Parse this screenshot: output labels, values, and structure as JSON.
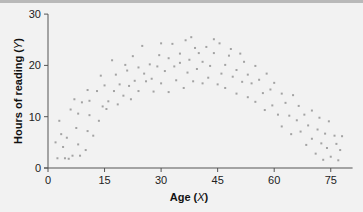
{
  "chart_data": {
    "type": "scatter",
    "title": "",
    "xlabel": "Age (X)",
    "ylabel": "Hours of reading (Y)",
    "xlabel_parts": {
      "text": "Age (",
      "var": "X",
      "close": ")"
    },
    "ylabel_parts": {
      "text": "Hours of reading (",
      "var": "Y",
      "close": ")"
    },
    "xlim": [
      0,
      80
    ],
    "ylim": [
      0,
      30
    ],
    "xticks": [
      0,
      15,
      30,
      45,
      60,
      75
    ],
    "yticks": [
      0,
      10,
      20,
      30
    ],
    "grid": false,
    "legend": null,
    "point_color": "#a3a3a3",
    "axis_color": "#555555",
    "points": [
      [
        2,
        5
      ],
      [
        2.5,
        1.9
      ],
      [
        3,
        9.2
      ],
      [
        3.5,
        6.6
      ],
      [
        4,
        4.1
      ],
      [
        4.5,
        1.9
      ],
      [
        5,
        5.9
      ],
      [
        5.5,
        1.8
      ],
      [
        6,
        11.4
      ],
      [
        6.5,
        2.4
      ],
      [
        7,
        13.4
      ],
      [
        7.5,
        7.8
      ],
      [
        8,
        10.6
      ],
      [
        8,
        4.6
      ],
      [
        8.5,
        2.4
      ],
      [
        9,
        12.8
      ],
      [
        10,
        3.5
      ],
      [
        10.5,
        15.2
      ],
      [
        10.5,
        7.2
      ],
      [
        11,
        10.3
      ],
      [
        11,
        13.1
      ],
      [
        12,
        6.3
      ],
      [
        13,
        15
      ],
      [
        13.5,
        9.2
      ],
      [
        14,
        18
      ],
      [
        14.5,
        12
      ],
      [
        15,
        16.1
      ],
      [
        15.5,
        11.5
      ],
      [
        16,
        13
      ],
      [
        17,
        21
      ],
      [
        17.5,
        15
      ],
      [
        18,
        18.2
      ],
      [
        18.5,
        12.4
      ],
      [
        19,
        16.3
      ],
      [
        20,
        14.1
      ],
      [
        20.5,
        20.1
      ],
      [
        21,
        19
      ],
      [
        21.5,
        16
      ],
      [
        22,
        13.4
      ],
      [
        22.5,
        21.8
      ],
      [
        23,
        17
      ],
      [
        24,
        19.6
      ],
      [
        24,
        15
      ],
      [
        25,
        23.8
      ],
      [
        25.5,
        18.4
      ],
      [
        26,
        16.9
      ],
      [
        27,
        20.2
      ],
      [
        27.5,
        17.4
      ],
      [
        28,
        14.9
      ],
      [
        29,
        19.8
      ],
      [
        29.5,
        22
      ],
      [
        30,
        16.5
      ],
      [
        30,
        24.3
      ],
      [
        31,
        18.9
      ],
      [
        32,
        21.4
      ],
      [
        32,
        14.8
      ],
      [
        33,
        24.2
      ],
      [
        33.5,
        19.8
      ],
      [
        34,
        17.1
      ],
      [
        35,
        22.3
      ],
      [
        35,
        20.5
      ],
      [
        36,
        15.6
      ],
      [
        36.5,
        24.9
      ],
      [
        37,
        18.6
      ],
      [
        37.5,
        21.1
      ],
      [
        38,
        25.5
      ],
      [
        38.5,
        16.9
      ],
      [
        39,
        23.4
      ],
      [
        39.5,
        19.3
      ],
      [
        40,
        22.4
      ],
      [
        41,
        20.7
      ],
      [
        41,
        16.5
      ],
      [
        42,
        23.6
      ],
      [
        42.5,
        17.6
      ],
      [
        43,
        19.9
      ],
      [
        44,
        25.1
      ],
      [
        44,
        22.4
      ],
      [
        45,
        16.3
      ],
      [
        45.5,
        24.3
      ],
      [
        46,
        18.4
      ],
      [
        47,
        20.1
      ],
      [
        47,
        15.6
      ],
      [
        48,
        21.9
      ],
      [
        48.5,
        23.2
      ],
      [
        49,
        17.8
      ],
      [
        50,
        19.1
      ],
      [
        50,
        14.5
      ],
      [
        51,
        22.3
      ],
      [
        51.5,
        16.8
      ],
      [
        52,
        20.7
      ],
      [
        53,
        18.2
      ],
      [
        53,
        13.8
      ],
      [
        54,
        16.5
      ],
      [
        55,
        19.9
      ],
      [
        55,
        12.9
      ],
      [
        56,
        17.2
      ],
      [
        57,
        14.6
      ],
      [
        57.5,
        11.3
      ],
      [
        58,
        18.4
      ],
      [
        59,
        15.3
      ],
      [
        59.5,
        12.2
      ],
      [
        60,
        16.6
      ],
      [
        61,
        10.4
      ],
      [
        62,
        14.5
      ],
      [
        62,
        8.1
      ],
      [
        63,
        12.7
      ],
      [
        64,
        10.2
      ],
      [
        64.5,
        6.6
      ],
      [
        65,
        14.2
      ],
      [
        66,
        9.3
      ],
      [
        66.5,
        12.1
      ],
      [
        67,
        7.1
      ],
      [
        68,
        10.4
      ],
      [
        68.5,
        4.5
      ],
      [
        69,
        8.3
      ],
      [
        70,
        11.2
      ],
      [
        70,
        5.7
      ],
      [
        71,
        2.8
      ],
      [
        71.5,
        7.5
      ],
      [
        72,
        9.8
      ],
      [
        72.5,
        4.8
      ],
      [
        73,
        1.6
      ],
      [
        73.5,
        6.7
      ],
      [
        74,
        3.9
      ],
      [
        74.5,
        9.1
      ],
      [
        75,
        2.2
      ],
      [
        76,
        6.3
      ],
      [
        76.5,
        4.7
      ],
      [
        77,
        1.5
      ],
      [
        77.5,
        3.5
      ],
      [
        78,
        6.2
      ]
    ]
  }
}
